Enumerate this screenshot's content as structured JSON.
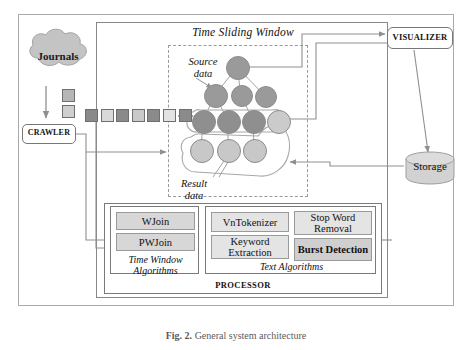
{
  "figure": {
    "caption_label": "Fig. 2.",
    "caption_text": "General system architecture"
  },
  "nodes": {
    "journals": "Journals",
    "crawler": "CRAWLER",
    "visualizer": "VISUALIZER",
    "storage": "Storage",
    "processor": "PROCESSOR"
  },
  "window": {
    "title": "Time Sliding Window",
    "source_label": "Source\ndata",
    "source_label_line1": "Source",
    "source_label_line2": "data",
    "result_label_line1": "Result",
    "result_label_line2": "data"
  },
  "processor": {
    "time_window": {
      "caption_line1": "Time Window",
      "caption_line2": "Algorithms",
      "items": [
        {
          "label": "WJoin",
          "emphasis": "normal"
        },
        {
          "label": "PWJoin",
          "emphasis": "normal"
        }
      ]
    },
    "text_algorithms": {
      "caption": "Text Algorithms",
      "items": [
        {
          "label": "VnTokenizer",
          "emphasis": "normal"
        },
        {
          "label": "Stop Word Removal",
          "emphasis": "normal"
        },
        {
          "label": "Keyword Extraction",
          "emphasis": "normal"
        },
        {
          "label": "Burst Detection",
          "emphasis": "bold"
        }
      ]
    }
  },
  "stream": {
    "squares": [
      {
        "shade": "#8a8a8a"
      },
      {
        "shade": "#d9d9d9"
      },
      {
        "shade": "#8a8a8a"
      },
      {
        "shade": "#c9c9c9"
      },
      {
        "shade": "#8a8a8a"
      },
      {
        "shade": "#e2e2e2"
      },
      {
        "shade": "#8a8a8a"
      }
    ],
    "queue_squares": [
      {
        "shade": "#b6b6b6"
      },
      {
        "shade": "#cfcfcf"
      }
    ]
  },
  "graph": {
    "source_nodes": [
      {
        "id": "s0",
        "cx": 237,
        "cy": 67,
        "r": 11,
        "shade": "#9a9a9a"
      },
      {
        "id": "s1",
        "cx": 215,
        "cy": 95,
        "r": 11,
        "shade": "#9a9a9a"
      },
      {
        "id": "s2",
        "cx": 241,
        "cy": 95,
        "r": 10,
        "shade": "#9a9a9a"
      },
      {
        "id": "s3",
        "cx": 265,
        "cy": 96,
        "r": 10,
        "shade": "#9a9a9a"
      },
      {
        "id": "s4",
        "cx": 203,
        "cy": 121,
        "r": 11,
        "shade": "#8f8f8f"
      },
      {
        "id": "s5",
        "cx": 228,
        "cy": 121,
        "r": 11,
        "shade": "#8f8f8f"
      },
      {
        "id": "s6",
        "cx": 253,
        "cy": 121,
        "r": 11,
        "shade": "#8f8f8f"
      },
      {
        "id": "s7",
        "cx": 278,
        "cy": 121,
        "r": 11,
        "shade": "#cbcbcb"
      }
    ],
    "result_nodes": [
      {
        "id": "r0",
        "cx": 201,
        "cy": 150,
        "r": 11,
        "shade": "#c8c8c8"
      },
      {
        "id": "r1",
        "cx": 228,
        "cy": 150,
        "r": 11,
        "shade": "#c8c8c8"
      },
      {
        "id": "r2",
        "cx": 254,
        "cy": 150,
        "r": 11,
        "shade": "#c8c8c8"
      }
    ],
    "colors": {
      "dark_node": "#9a9a9a",
      "light_node": "#c8c8c8",
      "edge": "#9d9d9d",
      "wire": "#8f8f8f",
      "dashed_border": "#9a9a9a"
    }
  },
  "colors": {
    "frame": "#aaaaaa",
    "system_frame": "#888888",
    "chip_fill": "#d7d7d7",
    "chip_fill_light": "#e4e4e4",
    "chip_fill_bold": "#cfcfcf",
    "cloud_fill": "#c4c4c4",
    "storage_fill": "#d2d2d2"
  }
}
